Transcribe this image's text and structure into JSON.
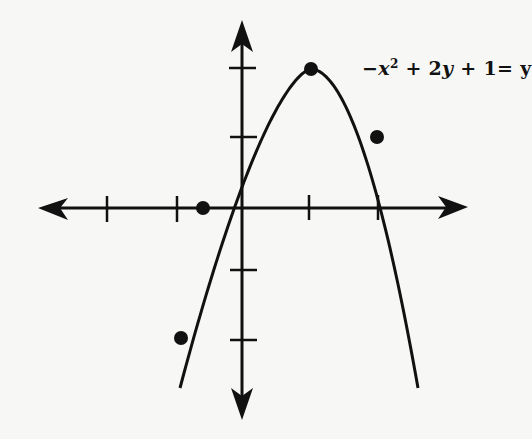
{
  "chart_data": {
    "type": "line",
    "title": "",
    "equation_label": "-x^2 + 2y + 1 = y",
    "equation_parts": {
      "minus": "−",
      "x": "x",
      "exp": "2",
      "mid1": " + 2",
      "y1": "y",
      "mid2": " + 1= ",
      "y2": "y"
    },
    "xlabel": "",
    "ylabel": "",
    "x_ticks": [
      -2,
      -1,
      1,
      2
    ],
    "y_ticks": [
      -2,
      -1,
      1,
      2
    ],
    "tick_labels_shown": false,
    "grid": false,
    "axes_arrows": true,
    "curve": {
      "kind": "parabola opening downward",
      "vertex": [
        1,
        2
      ],
      "formula_depicted": "y = -x^2 + 2x + 1",
      "x_range": [
        -1.1,
        2.6
      ]
    },
    "points": [
      {
        "x": 1,
        "y": 2
      },
      {
        "x": 2,
        "y": 1
      },
      {
        "x": -0.6,
        "y": 0
      },
      {
        "x": -0.9,
        "y": -1.9
      }
    ],
    "colors": {
      "line": "#111111",
      "background": "#f7f7f5"
    }
  }
}
